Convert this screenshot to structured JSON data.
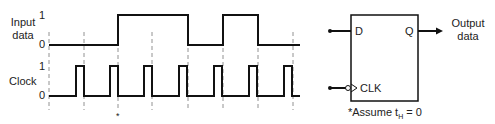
{
  "diagram": {
    "signals": {
      "input": {
        "label_line1": "Input",
        "label_line2": "data",
        "level_high": "1",
        "level_low": "0",
        "edges_x": [
          118,
          188,
          223,
          258
        ],
        "initial": 0
      },
      "clock": {
        "label": "Clock",
        "level_high": "1",
        "level_low": "0",
        "pulses": [
          [
            76,
            84
          ],
          [
            110,
            118
          ],
          [
            144,
            152
          ],
          [
            179,
            187
          ],
          [
            214,
            222
          ],
          [
            249,
            257
          ],
          [
            284,
            292
          ]
        ]
      }
    },
    "dashed_lines_x": [
      49,
      84,
      118,
      152,
      188,
      223,
      258,
      293
    ],
    "asterisk_marker": "*",
    "flipflop": {
      "input_d": "D",
      "output_q": "Q",
      "clock_input": "CLK",
      "output_label_line1": "Output",
      "output_label_line2": "data"
    },
    "footnote": {
      "prefix": "*Assume t",
      "subscript": "H",
      "suffix": " = 0"
    }
  }
}
